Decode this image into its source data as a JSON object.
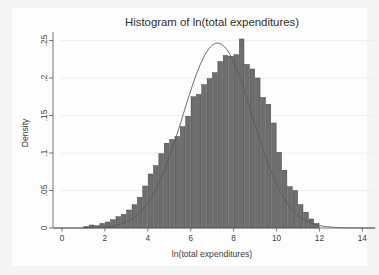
{
  "chart_data": {
    "type": "bar",
    "title": "Histogram of ln(total expenditures)",
    "xlabel": "ln(total expenditures)",
    "ylabel": "Density",
    "xlim": [
      -0.4,
      14.6
    ],
    "ylim": [
      0,
      0.262
    ],
    "grid": true,
    "legend": "none",
    "bin_width": 0.25,
    "xticks": [
      0,
      2,
      4,
      6,
      8,
      10,
      12,
      14
    ],
    "xtick_labels": [
      "0",
      "2",
      "4",
      "6",
      "8",
      "10",
      "12",
      "14"
    ],
    "yticks": [
      0,
      0.05,
      0.1,
      0.15,
      0.2,
      0.25
    ],
    "ytick_labels": [
      "0",
      ".05",
      ".1",
      ".15",
      ".2",
      ".25"
    ],
    "bar_color": "#6e6e6e",
    "bar_edge_color": "#3a3a3a",
    "curve_color": "#5a5a5a",
    "background_color": "#fdfdfd",
    "page_background_color": "#f4f4f4",
    "x": [
      1.125,
      1.375,
      1.625,
      1.875,
      2.125,
      2.375,
      2.625,
      2.875,
      3.125,
      3.375,
      3.625,
      3.875,
      4.125,
      4.375,
      4.625,
      4.875,
      5.125,
      5.375,
      5.625,
      5.875,
      6.125,
      6.375,
      6.625,
      6.875,
      7.125,
      7.375,
      7.625,
      7.875,
      8.125,
      8.375,
      8.625,
      8.875,
      9.125,
      9.375,
      9.625,
      9.875,
      10.125,
      10.375,
      10.625,
      10.875,
      11.125,
      11.375,
      11.625,
      11.875
    ],
    "values": [
      0.002,
      0.004,
      0.003,
      0.006,
      0.008,
      0.011,
      0.015,
      0.018,
      0.024,
      0.031,
      0.041,
      0.056,
      0.072,
      0.083,
      0.099,
      0.113,
      0.118,
      0.122,
      0.135,
      0.149,
      0.175,
      0.178,
      0.191,
      0.199,
      0.207,
      0.222,
      0.23,
      0.229,
      0.231,
      0.252,
      0.218,
      0.212,
      0.2,
      0.174,
      0.165,
      0.14,
      0.101,
      0.077,
      0.055,
      0.05,
      0.031,
      0.021,
      0.012,
      0.006
    ],
    "density_curve": {
      "label": "normal density overlay",
      "mean": 7.25,
      "sd": 1.62,
      "peak": 0.2465
    }
  }
}
